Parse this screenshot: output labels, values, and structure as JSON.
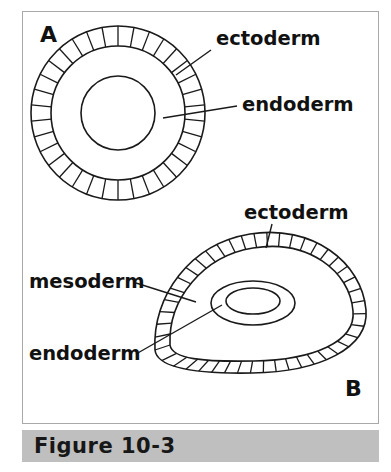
{
  "figure": {
    "caption": "Figure 10-3",
    "caption_bar_color": "#bfbfbf",
    "frame_border_color": "#a9a9a9",
    "background_color": "#ffffff"
  },
  "colors": {
    "ectoderm_fill": "#d9d9d9",
    "mesoderm_fill": "#b5b5b5",
    "endoderm_fill": "#b5b5b5",
    "cavity_fill": "#ffffff",
    "outline": "#1a1a1a",
    "text": "#111111"
  },
  "panels": [
    {
      "letter": "A",
      "letter_x": 40,
      "letter_y": 42,
      "description": "cross-section of early embryo, concentric rings",
      "geometry": {
        "cx": 118,
        "cy": 113,
        "r_outer": 87,
        "r_mid": 67,
        "r_inner": 37,
        "spoke_count": 34
      },
      "labels": [
        {
          "name": "ectoderm",
          "text": "ectoderm",
          "text_x": 216,
          "text_y": 45,
          "leader": "M 211 50 L 176 75"
        },
        {
          "name": "endoderm",
          "text": "endoderm",
          "text_x": 242,
          "text_y": 111,
          "leader": "M 237 106 L 163 118"
        }
      ]
    },
    {
      "letter": "B",
      "letter_x": 345,
      "letter_y": 396,
      "description": "three-dimensional view of embryo with mesoderm and gut cavity",
      "geometry": {
        "cx": 248,
        "cy": 307,
        "outer_path": "M 155 350 C 152 296 190 244 250 234 C 312 224 362 262 366 310 C 369 348 320 372 252 373 C 194 374 157 368 155 350 Z",
        "inner_path": "M 170 345 C 168 299 203 256 253 248 C 308 239 350 271 353 311 C 356 342 313 360 254 361 C 203 362 172 359 170 345 Z",
        "gut_ring": {
          "cx": 253,
          "cy": 303,
          "rx": 42,
          "ry": 22
        },
        "gut_cavity": {
          "cx": 253,
          "cy": 301,
          "rx": 27,
          "ry": 13
        },
        "spoke_count": 44
      },
      "labels": [
        {
          "name": "ectoderm",
          "text": "ectoderm",
          "text_x": 244,
          "text_y": 219,
          "leader": "M 272 224 L 266 248"
        },
        {
          "name": "mesoderm",
          "text": "mesoderm",
          "text_x": 29,
          "text_y": 288,
          "leader": "M 136 283 L 196 302"
        },
        {
          "name": "endoderm",
          "text": "endoderm",
          "text_x": 29,
          "text_y": 360,
          "leader": "M 136 354 L 222 305"
        }
      ]
    }
  ]
}
